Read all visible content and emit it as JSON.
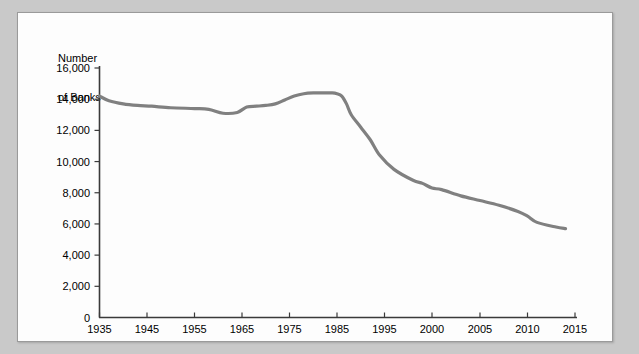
{
  "figure": {
    "background_color": "#c9c9c9",
    "panel_color": "#fdfdfd",
    "panel_border_color": "#9a9a9a",
    "line_color": "#808080",
    "axis_color": "#3a3a3a"
  },
  "chart_data": {
    "type": "line",
    "title": "",
    "subtitle": "",
    "xlabel": "",
    "ylabel": "Number\nof Banks",
    "ylabel_line1": "Number",
    "ylabel_line2": "of Banks",
    "xlim": [
      1935,
      2015
    ],
    "ylim": [
      0,
      16000
    ],
    "grid": false,
    "legend": null,
    "ytick_labels": [
      "0",
      "2,000",
      "4,000",
      "6,000",
      "8,000",
      "10,000",
      "12,000",
      "14,000",
      "16,000"
    ],
    "yticks": [
      0,
      2000,
      4000,
      6000,
      8000,
      10000,
      12000,
      14000,
      16000
    ],
    "xtick_labels": [
      "1935",
      "1945",
      "1955",
      "1965",
      "1975",
      "1985",
      "1995",
      "2000",
      "2005",
      "2010",
      "2015"
    ],
    "xticks": [
      1935,
      1945,
      1955,
      1965,
      1975,
      1985,
      1995,
      2000,
      2005,
      2010,
      2015
    ],
    "series": [
      {
        "name": "Number of Banks",
        "x": [
          1935,
          1937,
          1940,
          1943,
          1946,
          1950,
          1955,
          1958,
          1961,
          1964,
          1966,
          1968,
          1970,
          1972,
          1974,
          1976,
          1978,
          1980,
          1982,
          1984,
          1985,
          1986,
          1987,
          1988,
          1990,
          1992,
          1994,
          1996,
          1998,
          1999,
          2000,
          2001,
          2003,
          2005,
          2007,
          2009,
          2010,
          2011,
          2013,
          2014
        ],
        "y": [
          14200,
          13900,
          13700,
          13600,
          13550,
          13450,
          13400,
          13350,
          13100,
          13150,
          13500,
          13550,
          13600,
          13700,
          13950,
          14200,
          14350,
          14400,
          14400,
          14400,
          14350,
          14200,
          13700,
          13000,
          12200,
          11400,
          10400,
          9500,
          8800,
          8600,
          8300,
          8200,
          7800,
          7500,
          7200,
          6800,
          6500,
          6100,
          5800,
          5700
        ]
      }
    ]
  }
}
